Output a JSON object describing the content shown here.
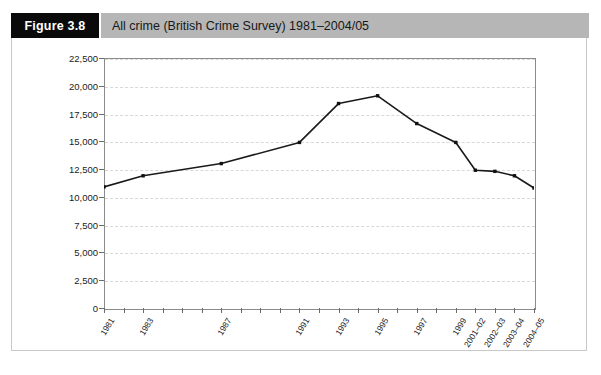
{
  "header": {
    "figure_tag": "Figure 3.8",
    "title": "All crime (British Crime Survey) 1981–2004/05"
  },
  "chart_data": {
    "type": "line",
    "title": "All crime (British Crime Survey) 1981–2004/05",
    "xlabel": "",
    "ylabel": "",
    "ylim": [
      0,
      22500
    ],
    "ytick_step": 2500,
    "grid": true,
    "legend": "none",
    "categories": [
      "1981",
      "1983",
      "1987",
      "1991",
      "1993",
      "1995",
      "1997",
      "1999",
      "2001–02",
      "2002–03",
      "2003–04",
      "2004–05"
    ],
    "values": [
      10900,
      11900,
      13000,
      14900,
      18400,
      19100,
      16600,
      14900,
      12400,
      12300,
      11900,
      10800
    ],
    "series": [
      {
        "name": "All crime (British Crime Survey)",
        "values": [
          10900,
          11900,
          13000,
          14900,
          18400,
          19100,
          16600,
          14900,
          12400,
          12300,
          11900,
          10800
        ]
      }
    ],
    "ytick_labels": [
      "0",
      "2,500",
      "5,000",
      "7,500",
      "10,000",
      "12,500",
      "15,000",
      "17,500",
      "20,000",
      "22,500"
    ],
    "ytick_values": [
      0,
      2500,
      5000,
      7500,
      10000,
      12500,
      15000,
      17500,
      20000,
      22500
    ],
    "xtick_labels": [
      "1981",
      "1983",
      "1987",
      "1991",
      "1993",
      "1995",
      "1997",
      "1999",
      "2001–02",
      "2002–03",
      "2003–04",
      "2004–05"
    ],
    "x_positions": [
      0,
      2,
      6,
      10,
      12,
      14,
      16,
      18,
      19,
      20,
      21,
      22
    ],
    "x_slots": 23,
    "colors": {
      "line": "#1a1a1a",
      "marker": "#111111",
      "grid": "#d8d8d8",
      "axis": "#8b8b8b",
      "tag_background": "#0a0a0a",
      "title_background": "#b6b6b6"
    }
  },
  "footnote": {
    "text": ""
  }
}
